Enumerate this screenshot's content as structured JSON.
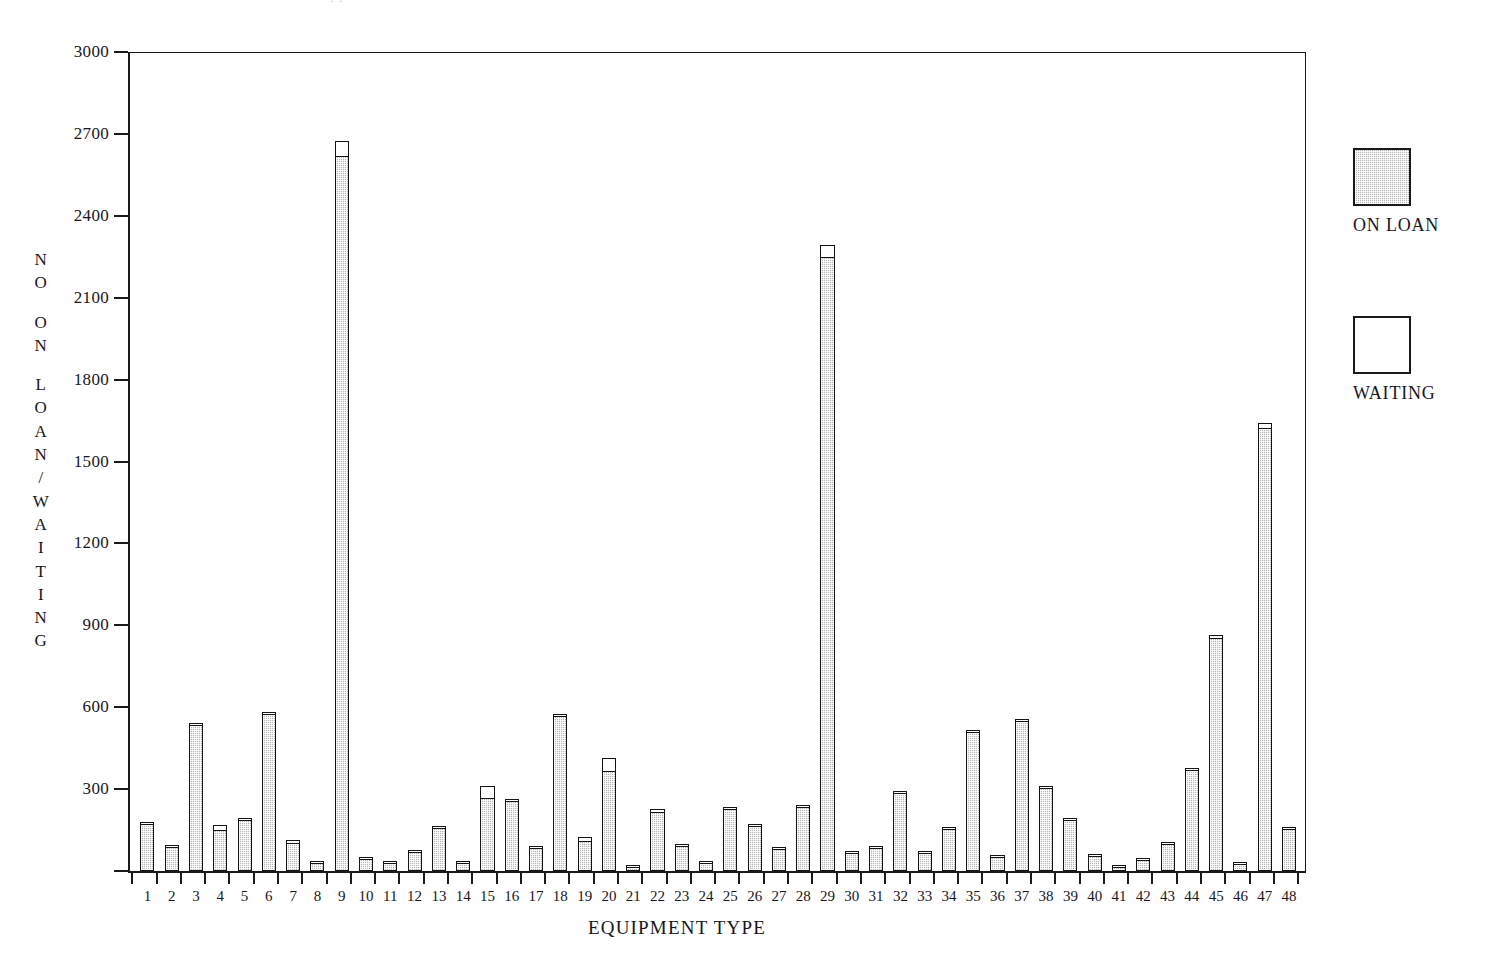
{
  "page": {
    "top_cut_text": "·  ·",
    "background_color": "#ffffff",
    "ink_color": "#1a1a1a"
  },
  "legend": {
    "position": "right",
    "entries": [
      {
        "id": "on-loan",
        "label": "ON LOAN",
        "swatch": "shaded",
        "color": "#b6b6b6"
      },
      {
        "id": "waiting",
        "label": "WAITING",
        "swatch": "open",
        "color": "#ffffff"
      }
    ]
  },
  "axes": {
    "y_caption_blocks": [
      [
        "N",
        "O"
      ],
      [
        "O",
        "N"
      ],
      [
        "L",
        "O",
        "A",
        "N",
        "/",
        "W",
        "A",
        "I",
        "T",
        "I",
        "N",
        "G"
      ]
    ],
    "y_caption_text": "NO ON LOAN/WAITING",
    "x_caption_text": "EQUIPMENT TYPE"
  },
  "chart_data": {
    "type": "bar",
    "title": "",
    "subtitle": "",
    "xlabel": "EQUIPMENT TYPE",
    "ylabel": "NO ON LOAN/WAITING",
    "ylim": [
      0,
      3000
    ],
    "yticks": [
      0,
      300,
      600,
      900,
      1200,
      1500,
      1800,
      2100,
      2400,
      2700,
      3000
    ],
    "ytick_labels": [
      "",
      "300",
      "600",
      "900",
      "1200",
      "1500",
      "1800",
      "2100",
      "2400",
      "2700",
      "3000"
    ],
    "grid": false,
    "stacked": true,
    "legend_position": "right",
    "categories": [
      "1",
      "2",
      "3",
      "4",
      "5",
      "6",
      "7",
      "8",
      "9",
      "10",
      "11",
      "12",
      "13",
      "14",
      "15",
      "16",
      "17",
      "18",
      "19",
      "20",
      "21",
      "22",
      "23",
      "24",
      "25",
      "26",
      "27",
      "28",
      "29",
      "30",
      "31",
      "32",
      "33",
      "34",
      "35",
      "36",
      "37",
      "38",
      "39",
      "40",
      "41",
      "42",
      "43",
      "44",
      "45",
      "46",
      "47",
      "48"
    ],
    "series": [
      {
        "name": "ON LOAN",
        "color": "#b6b6b6",
        "values": [
          175,
          88,
          538,
          150,
          188,
          578,
          105,
          30,
          2620,
          45,
          32,
          70,
          158,
          32,
          268,
          258,
          85,
          568,
          110,
          368,
          18,
          218,
          92,
          32,
          228,
          168,
          82,
          235,
          2250,
          68,
          85,
          288,
          68,
          155,
          512,
          52,
          552,
          305,
          190,
          55,
          15,
          42,
          100,
          372,
          855,
          28,
          1625,
          155
        ]
      },
      {
        "name": "WAITING",
        "color": "#ffffff",
        "values": [
          6,
          10,
          5,
          25,
          5,
          8,
          15,
          3,
          60,
          3,
          3,
          6,
          5,
          3,
          47,
          5,
          5,
          12,
          20,
          52,
          2,
          14,
          5,
          3,
          5,
          4,
          4,
          5,
          50,
          3,
          4,
          5,
          3,
          5,
          5,
          4,
          5,
          5,
          5,
          4,
          2,
          3,
          4,
          5,
          15,
          4,
          20,
          5
        ]
      }
    ],
    "totals": [
      181,
      98,
      543,
      175,
      193,
      586,
      120,
      33,
      2680,
      48,
      35,
      76,
      163,
      35,
      315,
      263,
      90,
      580,
      130,
      420,
      20,
      232,
      97,
      35,
      233,
      172,
      86,
      240,
      2300,
      71,
      89,
      293,
      71,
      160,
      517,
      56,
      557,
      310,
      195,
      59,
      17,
      45,
      104,
      377,
      870,
      32,
      1645,
      160
    ]
  }
}
